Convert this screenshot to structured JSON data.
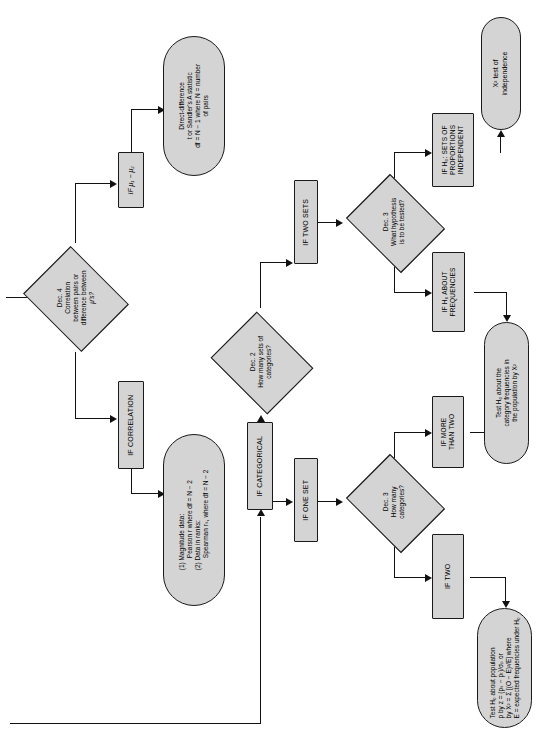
{
  "figure": {
    "type": "flowchart",
    "orientation": "rotated-90-counterclockwise",
    "topic": "Statistical test selection decision tree",
    "node_fill_color": "#d4d4d4",
    "line_color": "#111111",
    "background_color": "#ffffff"
  },
  "nodes": {
    "dec4": {
      "id": "dec-4",
      "shape": "diamond",
      "line1": "Dec. 4",
      "line2": "Correlation",
      "line3": "between pairs or",
      "line4": "difference between",
      "line5": "μ's?"
    },
    "if_mu_diff": {
      "id": "if-mu1-minus-mu2",
      "shape": "rectangle",
      "text": "IF μ₁ − μ₂"
    },
    "direct_difference": {
      "id": "direct-difference-test",
      "shape": "capsule",
      "line1": "Direct-difference",
      "line2": "t or Sandler's A statistic",
      "line3": "df = N − 1 where N = number",
      "line4": "of pairs"
    },
    "if_correlation": {
      "id": "if-correlation",
      "shape": "rectangle",
      "text": "IF CORRELATION"
    },
    "correlation_tests": {
      "id": "correlation-tests",
      "shape": "capsule",
      "line1": "(1)  Magnitude data:",
      "line2": "Pearson r where df = N − 2",
      "line3": "(2)  Data in ranks:",
      "line4": "Spearman rₛ, where df = N − 2"
    },
    "if_categorical": {
      "id": "if-categorical",
      "shape": "rectangle",
      "text": "IF CATEGORICAL"
    },
    "dec2": {
      "id": "dec-2",
      "shape": "diamond",
      "line1": "Dec. 2",
      "line2": "How many sets of",
      "line3": "categories?"
    },
    "if_two_sets": {
      "id": "if-two-sets",
      "shape": "rectangle",
      "text": "IF TWO SETS"
    },
    "if_one_set": {
      "id": "if-one-set",
      "shape": "rectangle",
      "text": "IF ONE SET"
    },
    "dec3_hypothesis": {
      "id": "dec-3-hypothesis",
      "shape": "diamond",
      "line1": "Dec. 3",
      "line2": "What hypothesis",
      "line3": "is to be tested?"
    },
    "if_h0_proportions": {
      "id": "if-h0-sets-of-proportions-independent",
      "shape": "rectangle",
      "line1": "IF H₀: SETS OF",
      "line2": "PROPORTIONS",
      "line3": "INDEPENDENT"
    },
    "if_h0_frequencies": {
      "id": "if-h0-about-frequencies",
      "shape": "rectangle",
      "line1": "IF H₀ ABOUT",
      "line2": "FREQUENCIES"
    },
    "chi_independence": {
      "id": "chi-square-test-of-independence",
      "shape": "capsule",
      "line1": "X² test of",
      "line2": "independence"
    },
    "dec3_categories": {
      "id": "dec-3-categories",
      "shape": "diamond",
      "line1": "Dec. 3",
      "line2": "How many",
      "line3": "categories?"
    },
    "if_more_than_two": {
      "id": "if-more-than-two",
      "shape": "rectangle",
      "line1": "IF MORE",
      "line2": "THAN TWO"
    },
    "if_two": {
      "id": "if-two",
      "shape": "rectangle",
      "text": "IF TWO"
    },
    "category_frequencies": {
      "id": "test-category-frequencies",
      "shape": "capsule",
      "line1": "Test H₀ about the",
      "line2": "category frequencies in",
      "line3": "the population by X²"
    },
    "population_proportion": {
      "id": "test-population-proportion",
      "shape": "capsule",
      "line1": "Test H₀ about population",
      "line2": "p by z = (pₛ − pₜ)/σₚ or",
      "line3": "by X² = Σ [(O − E)²/E] where",
      "line4": "E = expected frequencies under H₀"
    }
  }
}
